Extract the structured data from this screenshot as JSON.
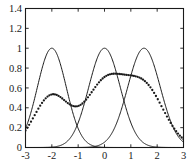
{
  "chart_data": {
    "type": "line",
    "title": "",
    "xlabel": "",
    "ylabel": "",
    "xlim": [
      -3,
      3
    ],
    "ylim": [
      0,
      1.4
    ],
    "grid": false,
    "legend": "none",
    "xticks": [
      -3,
      -2,
      -1,
      0,
      1,
      2,
      3
    ],
    "xtick_labels": [
      "-3",
      "-2",
      "-1",
      "0",
      "1",
      "2",
      "3"
    ],
    "yticks": [
      0,
      0.2,
      0.4,
      0.6,
      0.8,
      1,
      1.2,
      1.4
    ],
    "ytick_labels": [
      "0",
      "0.2",
      "0.4",
      "0.6",
      "0.8",
      "1",
      "1.2",
      "1.4"
    ],
    "series": [
      {
        "name": "component-1",
        "style": "solid",
        "kind": "gaussian",
        "peak_x": -2.0,
        "peak_y": 1.0,
        "sigma": 0.55,
        "x": [
          -3,
          -2.8,
          -2.6,
          -2.4,
          -2.2,
          -2,
          -1.8,
          -1.6,
          -1.4,
          -1.2,
          -1,
          -0.8,
          -0.6,
          -0.4,
          -0.2,
          0
        ],
        "values": [
          0.4,
          0.6,
          0.78,
          0.92,
          0.99,
          1.0,
          0.99,
          0.92,
          0.78,
          0.6,
          0.4,
          0.24,
          0.12,
          0.05,
          0.02,
          0.01
        ]
      },
      {
        "name": "component-2",
        "style": "solid",
        "kind": "gaussian",
        "peak_x": 0.0,
        "peak_y": 1.0,
        "sigma": 0.6,
        "x": [
          -2,
          -1.6,
          -1.2,
          -0.8,
          -0.4,
          0,
          0.4,
          0.8,
          1.2,
          1.6,
          2
        ],
        "values": [
          0.0038,
          0.035,
          0.14,
          0.41,
          0.8,
          1.0,
          0.8,
          0.41,
          0.14,
          0.035,
          0.0038
        ]
      },
      {
        "name": "component-3",
        "style": "solid",
        "kind": "gaussian",
        "peak_x": 1.5,
        "peak_y": 1.0,
        "sigma": 0.62,
        "x": [
          -0.5,
          0,
          0.5,
          1,
          1.5,
          2,
          2.5,
          3
        ],
        "values": [
          0.008,
          0.05,
          0.22,
          0.62,
          1.0,
          0.62,
          0.22,
          0.05
        ]
      },
      {
        "name": "mixture-sum",
        "style": "dotted",
        "kind": "mixture",
        "peak_y": 1.16,
        "shoulder_x": -2.0,
        "shoulder_y": 0.52,
        "x": [
          -3,
          -2.75,
          -2.5,
          -2.25,
          -2,
          -1.75,
          -1.5,
          -1.25,
          -1,
          -0.75,
          -0.5,
          -0.25,
          0,
          0.25,
          0.5,
          0.75,
          1,
          1.25,
          1.5,
          1.75,
          2,
          2.25,
          2.5,
          2.75,
          3
        ],
        "values": [
          0.17,
          0.27,
          0.38,
          0.47,
          0.52,
          0.51,
          0.48,
          0.46,
          0.5,
          0.62,
          0.8,
          1.0,
          1.11,
          1.15,
          1.16,
          1.15,
          1.15,
          1.15,
          1.14,
          1.05,
          0.88,
          0.66,
          0.45,
          0.27,
          0.13
        ]
      }
    ]
  },
  "axes": {
    "frame_color": "#1a1a1a",
    "line_color": "#1a1a1a",
    "background": "#ffffff"
  }
}
